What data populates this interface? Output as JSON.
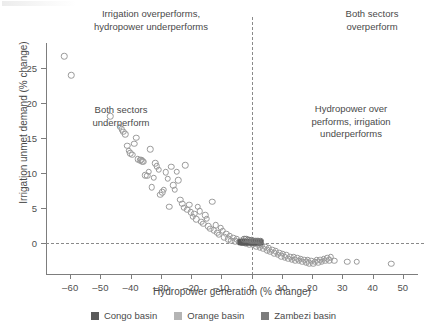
{
  "chart_data": {
    "type": "scatter",
    "title": "",
    "xlabel": "Hydropower generation (% change)",
    "ylabel": "Irrigation unmet demand (% change)",
    "xlim": [
      -68,
      55
    ],
    "ylim": [
      28.5,
      -4.5
    ],
    "y_axis_inverted": true,
    "grid": false,
    "xticks": [
      -60,
      -50,
      -40,
      -30,
      -20,
      -10,
      0,
      10,
      20,
      30,
      40,
      50
    ],
    "xticklabels": [
      "–60",
      "–50",
      "–40",
      "–30",
      "–20",
      "–10",
      "0",
      "10",
      "20",
      "30",
      "40",
      "50"
    ],
    "yticks": [
      0,
      5,
      10,
      15,
      20,
      25
    ],
    "yticklabels": [
      "0",
      "5",
      "10",
      "15",
      "20",
      "25"
    ],
    "reference_lines": [
      {
        "orientation": "vertical",
        "value": 0,
        "style": "dashed"
      },
      {
        "orientation": "horizontal",
        "value": 0,
        "style": "dashed"
      }
    ],
    "annotations": [
      {
        "name": "top-left",
        "text": "Irrigation overperforms,\nhydropower underperforms",
        "quadrant": "x<0, y<0"
      },
      {
        "name": "top-right",
        "text": "Both sectors\noverperform",
        "quadrant": "x>0, y<0"
      },
      {
        "name": "bottom-left",
        "text": "Both sectors\nunderperform",
        "quadrant": "x<0, y>0"
      },
      {
        "name": "bottom-right",
        "text": "Hydropower over\nperforms, irrigation\nunderperforms",
        "quadrant": "x>0, y>0"
      }
    ],
    "legend": {
      "position": "below-axis",
      "entries": [
        {
          "label": "Congo basin",
          "color": "#5a5a5a"
        },
        {
          "label": "Orange basin",
          "color": "#b4b4b4"
        },
        {
          "label": "Zambezi basin",
          "color": "#7c7c7c"
        }
      ]
    },
    "series": [
      {
        "name": "Orange basin",
        "marker": "open-circle",
        "color": "#9a9a9a",
        "points": [
          [
            -62.0,
            26.6
          ],
          [
            -59.6,
            23.9
          ],
          [
            -46.8,
            18.1
          ],
          [
            -43.6,
            16.6
          ],
          [
            -43.0,
            16.2
          ],
          [
            -42.4,
            15.9
          ],
          [
            -41.8,
            15.5
          ],
          [
            -41.2,
            13.9
          ],
          [
            -40.6,
            13.2
          ],
          [
            -40.1,
            12.8
          ],
          [
            -39.4,
            12.6
          ],
          [
            -38.8,
            14.2
          ],
          [
            -38.2,
            15.0
          ],
          [
            -37.6,
            12.0
          ],
          [
            -36.9,
            11.8
          ],
          [
            -36.5,
            11.9
          ],
          [
            -36.2,
            11.7
          ],
          [
            -35.8,
            11.6
          ],
          [
            -35.2,
            9.7
          ],
          [
            -34.6,
            9.6
          ],
          [
            -34.1,
            10.2
          ],
          [
            -33.6,
            13.4
          ],
          [
            -33.0,
            8.0
          ],
          [
            -32.4,
            9.3
          ],
          [
            -31.9,
            11.4
          ],
          [
            -31.3,
            11.0
          ],
          [
            -30.8,
            10.5
          ],
          [
            -30.2,
            6.9
          ],
          [
            -29.6,
            7.3
          ],
          [
            -29.0,
            7.6
          ],
          [
            -28.4,
            10.1
          ],
          [
            -27.8,
            9.2
          ],
          [
            -27.2,
            5.2
          ],
          [
            -26.6,
            10.9
          ],
          [
            -26.0,
            8.3
          ],
          [
            -25.4,
            7.6
          ],
          [
            -24.8,
            10.2
          ],
          [
            -24.2,
            9.0
          ],
          [
            -23.6,
            6.2
          ],
          [
            -23.0,
            5.6
          ],
          [
            -22.4,
            5.1
          ],
          [
            -21.9,
            11.1
          ],
          [
            -21.3,
            4.8
          ],
          [
            -20.7,
            5.5
          ],
          [
            -20.1,
            4.4
          ],
          [
            -19.5,
            3.8
          ],
          [
            -19.0,
            4.2
          ],
          [
            -18.4,
            3.4
          ],
          [
            -17.8,
            5.2
          ],
          [
            -17.2,
            4.6
          ],
          [
            -16.6,
            3.1
          ],
          [
            -16.0,
            2.8
          ],
          [
            -15.4,
            4.0
          ],
          [
            -14.9,
            3.5
          ],
          [
            -14.3,
            2.4
          ],
          [
            -13.7,
            2.1
          ],
          [
            -13.1,
            5.9
          ],
          [
            -12.5,
            1.9
          ],
          [
            -11.9,
            2.6
          ],
          [
            -11.3,
            1.5
          ],
          [
            -10.8,
            1.2
          ],
          [
            -10.2,
            2.2
          ],
          [
            -9.6,
            1.8
          ],
          [
            -9.0,
            0.9
          ],
          [
            -8.4,
            1.4
          ],
          [
            -7.8,
            0.6
          ],
          [
            -7.2,
            1.1
          ],
          [
            -6.7,
            0.4
          ],
          [
            -6.1,
            0.8
          ],
          [
            -5.5,
            0.3
          ],
          [
            -4.9,
            0.6
          ],
          [
            -4.3,
            0.2
          ],
          [
            -3.7,
            0.4
          ],
          [
            -3.1,
            0.1
          ],
          [
            -2.6,
            0.3
          ],
          [
            -2.0,
            0.0
          ],
          [
            -1.4,
            0.2
          ],
          [
            -0.8,
            -0.1
          ],
          [
            -0.2,
            0.1
          ],
          [
            0.4,
            -0.2
          ],
          [
            1.0,
            0.0
          ],
          [
            1.6,
            -0.4
          ],
          [
            2.1,
            -0.2
          ],
          [
            2.7,
            -0.6
          ],
          [
            3.3,
            -0.3
          ],
          [
            3.9,
            -0.8
          ],
          [
            4.5,
            -0.5
          ],
          [
            5.1,
            -1.0
          ],
          [
            5.7,
            -0.7
          ],
          [
            6.2,
            -1.2
          ],
          [
            6.8,
            -0.9
          ],
          [
            7.4,
            -1.4
          ],
          [
            8.0,
            -1.1
          ],
          [
            8.6,
            -1.6
          ],
          [
            9.2,
            -1.3
          ],
          [
            9.8,
            -1.8
          ],
          [
            10.3,
            -1.5
          ],
          [
            10.9,
            -2.0
          ],
          [
            11.5,
            -1.7
          ],
          [
            12.1,
            -2.2
          ],
          [
            12.7,
            -1.9
          ],
          [
            13.3,
            -2.3
          ],
          [
            13.9,
            -2.0
          ],
          [
            14.4,
            -2.4
          ],
          [
            15.0,
            -2.1
          ],
          [
            15.6,
            -2.5
          ],
          [
            16.2,
            -2.2
          ],
          [
            16.8,
            -2.6
          ],
          [
            17.4,
            -2.3
          ],
          [
            18.0,
            -2.7
          ],
          [
            18.5,
            -2.4
          ],
          [
            19.1,
            -2.8
          ],
          [
            19.7,
            -2.5
          ],
          [
            20.3,
            -2.9
          ],
          [
            20.9,
            -2.6
          ],
          [
            21.5,
            -2.4
          ],
          [
            22.1,
            -2.7
          ],
          [
            22.6,
            -2.3
          ],
          [
            23.2,
            -2.6
          ],
          [
            23.8,
            -2.2
          ],
          [
            24.4,
            -2.5
          ],
          [
            25.0,
            -2.1
          ],
          [
            25.6,
            -2.4
          ],
          [
            26.2,
            -2.0
          ],
          [
            27.3,
            -2.5
          ],
          [
            31.6,
            -2.6
          ],
          [
            34.8,
            -2.6
          ],
          [
            46.2,
            -2.9
          ]
        ]
      },
      {
        "name": "Congo basin",
        "marker": "filled-square-cluster",
        "color": "#5a5a5a",
        "points": [
          [
            -3.6,
            0.15
          ],
          [
            -3.2,
            0.15
          ],
          [
            -2.8,
            0.15
          ],
          [
            -2.4,
            0.15
          ],
          [
            -2.0,
            0.15
          ],
          [
            -1.6,
            0.15
          ],
          [
            -1.2,
            0.15
          ],
          [
            -0.8,
            0.15
          ],
          [
            -0.4,
            0.15
          ],
          [
            0.0,
            0.15
          ],
          [
            0.4,
            0.15
          ],
          [
            0.8,
            0.15
          ],
          [
            1.2,
            0.15
          ],
          [
            1.6,
            0.15
          ],
          [
            2.0,
            0.15
          ],
          [
            2.4,
            0.15
          ],
          [
            2.8,
            0.15
          ]
        ]
      },
      {
        "name": "Zambezi basin",
        "marker": "open-circle",
        "color": "#7c7c7c",
        "points": [
          [
            -1.8,
            0.55
          ],
          [
            -1.2,
            0.5
          ],
          [
            -0.6,
            0.45
          ],
          [
            0.0,
            0.42
          ],
          [
            0.6,
            0.4
          ],
          [
            1.2,
            0.38
          ],
          [
            1.8,
            0.35
          ],
          [
            2.4,
            0.33
          ],
          [
            -2.4,
            0.6
          ],
          [
            3.0,
            0.3
          ]
        ]
      }
    ]
  },
  "legend": {
    "entries": [
      {
        "label": "Congo basin",
        "color": "#5a5a5a"
      },
      {
        "label": "Orange basin",
        "color": "#b4b4b4"
      },
      {
        "label": "Zambezi basin",
        "color": "#7c7c7c"
      }
    ]
  },
  "axes": {
    "xlabel": "Hydropower generation (% change)",
    "ylabel": "Irrigation unmet demand (% change)"
  },
  "annotations": {
    "top_left": "Irrigation overperforms,\nhydropower underperforms",
    "top_right": "Both sectors\noverperform",
    "bottom_left": "Both sectors\nunderperform",
    "bottom_right": "Hydropower over\nperforms, irrigation\nunderperforms"
  }
}
